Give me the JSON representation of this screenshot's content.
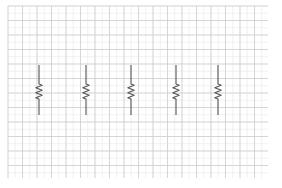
{
  "diagram": {
    "type": "circuit-sketch-on-graph-paper",
    "background": "#ffffff",
    "grid": {
      "x0": 8,
      "y0": 6,
      "x1": 268,
      "y1": 178,
      "major_step": 14.5,
      "minor_step": 7.25,
      "major_color": "#cfcfcf",
      "minor_color": "#e8e8e8"
    },
    "components": [
      {
        "kind": "resistor",
        "orientation": "vertical",
        "x": 39,
        "y_top": 65,
        "y_bottom": 115
      },
      {
        "kind": "resistor",
        "orientation": "vertical",
        "x": 86,
        "y_top": 65,
        "y_bottom": 115
      },
      {
        "kind": "resistor",
        "orientation": "vertical",
        "x": 131,
        "y_top": 65,
        "y_bottom": 115
      },
      {
        "kind": "resistor",
        "orientation": "vertical",
        "x": 176,
        "y_top": 65,
        "y_bottom": 115
      },
      {
        "kind": "resistor",
        "orientation": "vertical",
        "x": 218,
        "y_top": 65,
        "y_bottom": 115
      }
    ],
    "stroke_color": "#555555"
  }
}
